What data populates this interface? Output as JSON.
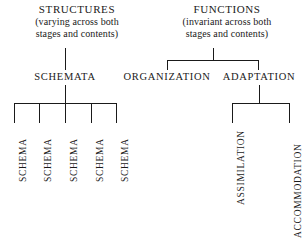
{
  "diagram": {
    "background_color": "#ffffff",
    "line_color": "#1a1a1a",
    "text_color": "#1a1a1a"
  },
  "headers": {
    "structures": {
      "title": "STRUCTURES",
      "sub_line1": "(varying across both",
      "sub_line2": "stages and contents)"
    },
    "functions": {
      "title": "FUNCTIONS",
      "sub_line1": "(invariant across both",
      "sub_line2": "stages and contents)"
    }
  },
  "nodes": {
    "schemata": "SCHEMATA",
    "organization": "ORGANIZATION",
    "adaptation": "ADAPTATION"
  },
  "leaves": {
    "schemas": [
      "SCHEMA",
      "SCHEMA",
      "SCHEMA",
      "SCHEMA",
      "SCHEMA"
    ],
    "adaptation_children": [
      "ASSIMILATION",
      "ACCOMMODATION"
    ]
  }
}
